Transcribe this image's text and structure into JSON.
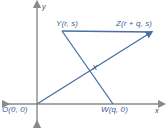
{
  "figure": {
    "axes": {
      "x_label": "x",
      "y_label": "y",
      "axis_color": "#8a8a8a",
      "origin_px": [
        37,
        104
      ]
    },
    "line_color": "#4a6fa5",
    "label_color": "#3f5e96",
    "points": [
      {
        "name": "Y",
        "label": "Y(r, s)",
        "px": [
          62,
          31
        ]
      },
      {
        "name": "Z",
        "label": "Z(r + q, s)",
        "px": [
          152,
          32
        ]
      },
      {
        "name": "O",
        "label": "O(0, 0)",
        "px": [
          37,
          104
        ]
      },
      {
        "name": "W",
        "label": "W(q, 0)",
        "px": [
          113,
          104
        ]
      },
      {
        "name": "X",
        "label": "X",
        "px": [
          88,
          69
        ]
      }
    ],
    "segments": [
      {
        "name": "segment-YZ",
        "from": "Y",
        "to": "Z"
      },
      {
        "name": "segment-YW",
        "from": "Y",
        "to": "W"
      },
      {
        "name": "segment-OZ",
        "from": "O",
        "to": "Z"
      }
    ]
  }
}
